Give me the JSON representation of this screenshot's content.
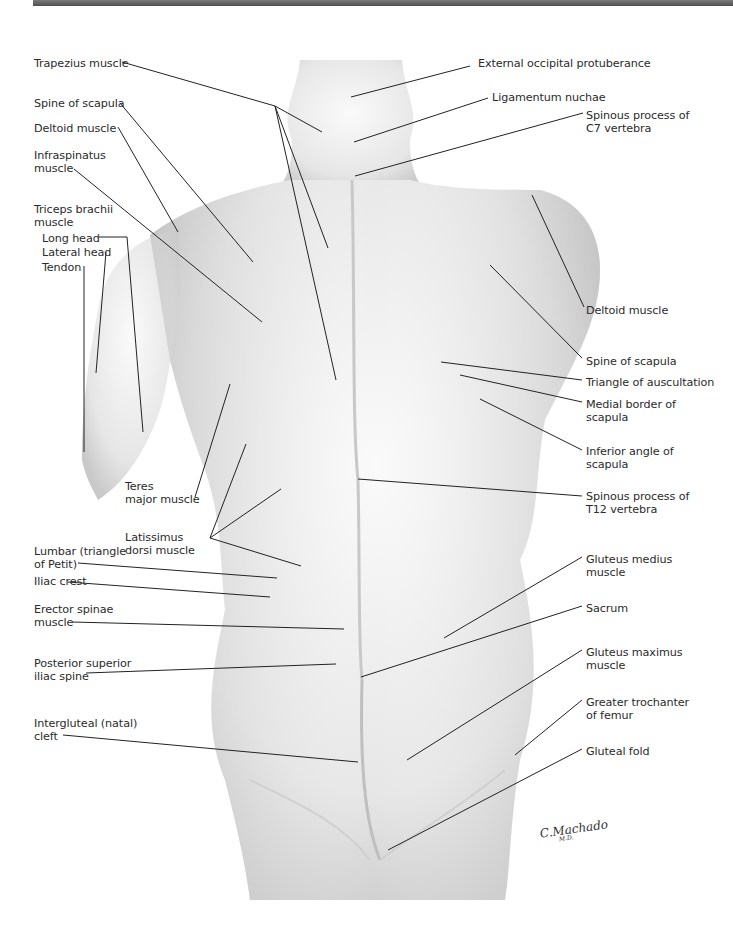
{
  "figure": {
    "signature": "C.Machado",
    "signature_suffix": "M.D.",
    "header_bar_color": "#5c5c5c",
    "line_color": "#222222",
    "skin_color": "#ececec"
  },
  "labels_left": [
    {
      "id": "trapezius",
      "text": "Trapezius muscle",
      "x": 34,
      "y": 57
    },
    {
      "id": "spine-scapula-l",
      "text": "Spine of scapula",
      "x": 34,
      "y": 97
    },
    {
      "id": "deltoid-l",
      "text": "Deltoid muscle",
      "x": 34,
      "y": 122
    },
    {
      "id": "infraspinatus",
      "text": "Infraspinatus\nmuscle",
      "x": 34,
      "y": 149
    },
    {
      "id": "triceps",
      "text": "Triceps brachii\nmuscle",
      "x": 34,
      "y": 203
    },
    {
      "id": "triceps-long",
      "text": "Long head",
      "x": 42,
      "y": 232
    },
    {
      "id": "triceps-lateral",
      "text": "Lateral head",
      "x": 42,
      "y": 246
    },
    {
      "id": "triceps-tendon",
      "text": "Tendon",
      "x": 42,
      "y": 261
    },
    {
      "id": "teres-major",
      "text": "Teres\nmajor muscle",
      "x": 125,
      "y": 480
    },
    {
      "id": "latissimus",
      "text": "Latissimus\ndorsi muscle",
      "x": 125,
      "y": 531
    },
    {
      "id": "lumbar-triangle",
      "text": "Lumbar (triangle\nof Petit)",
      "x": 34,
      "y": 545
    },
    {
      "id": "iliac-crest",
      "text": "Iliac crest",
      "x": 34,
      "y": 575
    },
    {
      "id": "erector-spinae",
      "text": "Erector spinae\nmuscle",
      "x": 34,
      "y": 603
    },
    {
      "id": "psis",
      "text": "Posterior superior\niliac spine",
      "x": 34,
      "y": 657
    },
    {
      "id": "intergluteal",
      "text": "Intergluteal (natal)\ncleft",
      "x": 34,
      "y": 717
    }
  ],
  "labels_right": [
    {
      "id": "ext-occipital",
      "text": "External occipital protuberance",
      "x": 478,
      "y": 57
    },
    {
      "id": "lig-nuchae",
      "text": "Ligamentum nuchae",
      "x": 492,
      "y": 91
    },
    {
      "id": "c7",
      "text": "Spinous process of\nC7 vertebra",
      "x": 586,
      "y": 109
    },
    {
      "id": "deltoid-r",
      "text": "Deltoid muscle",
      "x": 586,
      "y": 304
    },
    {
      "id": "spine-scapula-r",
      "text": "Spine of scapula",
      "x": 586,
      "y": 355
    },
    {
      "id": "auscultation",
      "text": "Triangle of auscultation",
      "x": 586,
      "y": 376
    },
    {
      "id": "medial-border",
      "text": "Medial border of\nscapula",
      "x": 586,
      "y": 398
    },
    {
      "id": "inferior-angle",
      "text": "Inferior angle of\nscapula",
      "x": 586,
      "y": 445
    },
    {
      "id": "t12",
      "text": "Spinous process of\nT12 vertebra",
      "x": 586,
      "y": 490
    },
    {
      "id": "gluteus-medius",
      "text": "Gluteus medius\nmuscle",
      "x": 586,
      "y": 553
    },
    {
      "id": "sacrum",
      "text": "Sacrum",
      "x": 586,
      "y": 602
    },
    {
      "id": "gluteus-maximus",
      "text": "Gluteus maximus\nmuscle",
      "x": 586,
      "y": 646
    },
    {
      "id": "greater-trochanter",
      "text": "Greater trochanter\nof femur",
      "x": 586,
      "y": 696
    },
    {
      "id": "gluteal-fold",
      "text": "Gluteal fold",
      "x": 586,
      "y": 745
    }
  ],
  "leader_lines": [
    [
      122,
      62,
      275,
      106
    ],
    [
      275,
      106,
      322,
      132
    ],
    [
      275,
      106,
      328,
      248
    ],
    [
      275,
      106,
      336,
      380
    ],
    [
      120,
      103,
      253,
      262
    ],
    [
      118,
      127,
      178,
      232
    ],
    [
      74,
      169,
      262,
      322
    ],
    [
      99,
      237,
      127,
      237
    ],
    [
      127,
      237,
      143,
      432
    ],
    [
      106,
      252,
      96,
      373
    ],
    [
      84,
      266,
      84,
      452
    ],
    [
      195,
      497,
      230,
      384
    ],
    [
      210,
      538,
      246,
      444
    ],
    [
      210,
      538,
      281,
      489
    ],
    [
      210,
      538,
      301,
      566
    ],
    [
      78,
      563,
      277,
      578
    ],
    [
      68,
      582,
      270,
      597
    ],
    [
      72,
      622,
      344,
      629
    ],
    [
      86,
      673,
      336,
      664
    ],
    [
      63,
      735,
      358,
      762
    ],
    [
      470,
      66,
      351,
      97
    ],
    [
      488,
      98,
      354,
      142
    ],
    [
      583,
      113,
      355,
      176
    ],
    [
      584,
      307,
      532,
      195
    ],
    [
      582,
      358,
      490,
      265
    ],
    [
      582,
      380,
      441,
      362
    ],
    [
      582,
      402,
      460,
      375
    ],
    [
      582,
      450,
      480,
      399
    ],
    [
      582,
      496,
      358,
      479
    ],
    [
      582,
      557,
      444,
      638
    ],
    [
      582,
      606,
      361,
      677
    ],
    [
      582,
      650,
      407,
      760
    ],
    [
      582,
      700,
      515,
      755
    ],
    [
      582,
      749,
      388,
      850
    ]
  ]
}
